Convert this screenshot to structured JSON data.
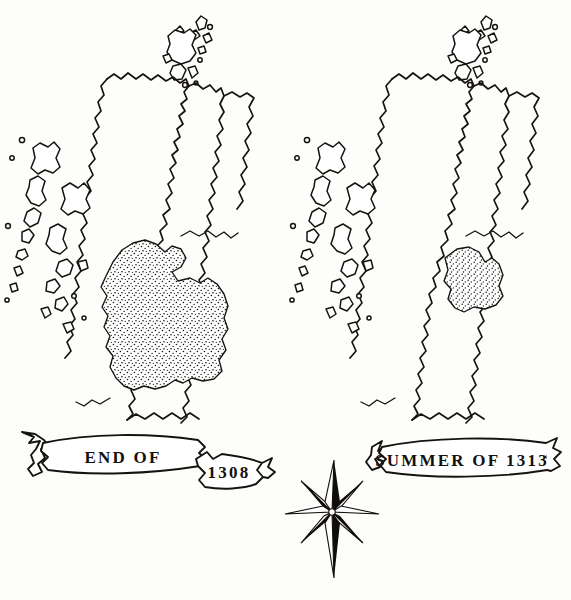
{
  "figure": {
    "medium": "pen-and-ink line drawing",
    "ink_color": "#16130f",
    "paper_color": "#fdfdfc"
  },
  "panels": [
    {
      "id": "left",
      "banner_label": "END  OF",
      "tail_label": "1308",
      "region_note": "large stippled area covering central and south-west Scotland",
      "stipple_extent": "broad"
    },
    {
      "id": "right",
      "banner_label": "SUMMER  OF  1313",
      "tail_label": "",
      "region_note": "small stippled area confined to the eastern lowlands",
      "stipple_extent": "narrow"
    }
  ],
  "compass": {
    "name": "compass-rose",
    "points": 8,
    "style": "half-shaded star, long north-south spikes"
  }
}
